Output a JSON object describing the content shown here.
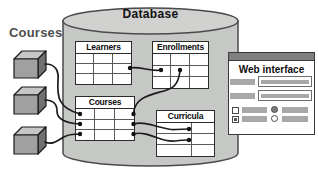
{
  "diagram": {
    "external_label": "Courses",
    "database": {
      "title": "Database",
      "tables": [
        {
          "name": "Learners",
          "rows": 3,
          "cols": 3
        },
        {
          "name": "Enrollments",
          "rows": 3,
          "cols": 3
        },
        {
          "name": "Courses",
          "rows": 3,
          "cols": 3
        },
        {
          "name": "Curricula",
          "rows": 3,
          "cols": 2,
          "col_template": "1.55fr 1fr"
        }
      ]
    },
    "cubes": {
      "count": 3,
      "represents": "Courses"
    },
    "web_interface": {
      "title": "Web interface",
      "controls": {
        "checkbox_1_checked": false,
        "checkbox_2_checked": true,
        "radio_1_selected": true,
        "radio_2_selected": false
      }
    },
    "colors": {
      "cylinder_fill": "#c6c8c5",
      "cylinder_top_fill": "#d1d2d0",
      "outline": "#4a4a4a",
      "wire": "#1c1c1c",
      "cube_front": "#a0a0a0",
      "cube_top": "#c6c6c6",
      "cube_side": "#707070",
      "window_titlebar": "#7f7f7f",
      "control_bar": "#a8a8a8"
    }
  }
}
